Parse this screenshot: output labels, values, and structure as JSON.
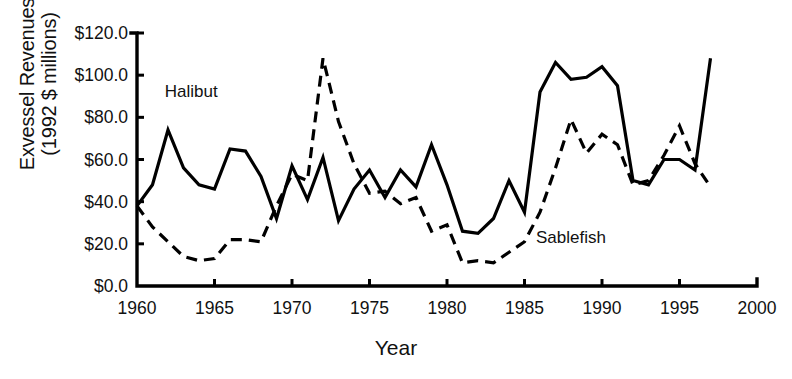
{
  "chart_data": {
    "type": "line",
    "title": "",
    "xlabel": "Year",
    "ylabel": "Exvessel Revenues (1992 $ millions)",
    "ylabel_line1": "Exvessel Revenues",
    "ylabel_line2": "(1992 $ millions)",
    "xlim": [
      1960,
      2000
    ],
    "ylim": [
      0,
      120
    ],
    "xticks": [
      1960,
      1965,
      1970,
      1975,
      1980,
      1985,
      1990,
      1995,
      2000
    ],
    "xtick_labels": [
      "1960",
      "1965",
      "1970",
      "1975",
      "1980",
      "1985",
      "1990",
      "1995",
      "2000"
    ],
    "yticks": [
      0,
      20,
      40,
      60,
      80,
      100,
      120
    ],
    "ytick_labels": [
      "$0.0",
      "$20.0",
      "$40.0",
      "$60.0",
      "$80.0",
      "$100.0",
      "$120.0"
    ],
    "grid": false,
    "legend_position": "inline-annotation",
    "series": [
      {
        "name": "Halibut",
        "style": "solid",
        "color": "#000000",
        "annotation": "Halibut",
        "x": [
          1960,
          1961,
          1962,
          1963,
          1964,
          1965,
          1966,
          1967,
          1968,
          1969,
          1970,
          1971,
          1972,
          1973,
          1974,
          1975,
          1976,
          1977,
          1978,
          1979,
          1980,
          1981,
          1982,
          1983,
          1984,
          1985,
          1986,
          1987,
          1988,
          1989,
          1990,
          1991,
          1992,
          1993,
          1994,
          1995,
          1996,
          1997
        ],
        "values": [
          38,
          48,
          74,
          56,
          48,
          46,
          65,
          64,
          52,
          32,
          57,
          41,
          61,
          31,
          46,
          55,
          42,
          55,
          47,
          67,
          48,
          26,
          25,
          32,
          50,
          35,
          92,
          106,
          98,
          99,
          104,
          95,
          50,
          48,
          60,
          60,
          55,
          108
        ]
      },
      {
        "name": "Sablefish",
        "style": "dashed",
        "color": "#000000",
        "annotation": "Sablefish",
        "x": [
          1960,
          1961,
          1962,
          1963,
          1964,
          1965,
          1966,
          1967,
          1968,
          1969,
          1970,
          1971,
          1972,
          1973,
          1974,
          1975,
          1976,
          1977,
          1978,
          1979,
          1980,
          1981,
          1982,
          1983,
          1984,
          1985,
          1986,
          1987,
          1988,
          1989,
          1990,
          1991,
          1992,
          1993,
          1994,
          1995,
          1996,
          1997
        ],
        "values": [
          38,
          28,
          21,
          14,
          12,
          13,
          22,
          22,
          21,
          38,
          53,
          50,
          108,
          78,
          58,
          44,
          45,
          39,
          42,
          26,
          29,
          11,
          12,
          11,
          16,
          21,
          35,
          56,
          79,
          63,
          72,
          67,
          48,
          50,
          62,
          76,
          58,
          47
        ]
      }
    ],
    "annotations": [
      {
        "text": "Halibut",
        "x": 1963.5,
        "y": 92
      },
      {
        "text": "Sablefish",
        "x": 1988.0,
        "y": 23
      }
    ]
  },
  "colors": {
    "line": "#000000",
    "axis": "#000000",
    "background": "#ffffff",
    "text": "#111111"
  }
}
